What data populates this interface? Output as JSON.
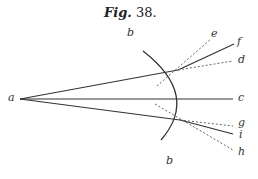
{
  "figure": {
    "title_word": "Fig.",
    "title_number": " 38.",
    "labels": {
      "a": "a",
      "b_top": "b",
      "b_bottom": "b",
      "c": "c",
      "d": "d",
      "e": "e",
      "f": "f",
      "g": "g",
      "h": "h",
      "i": "i"
    },
    "colors": {
      "line": "#333333",
      "dashed": "#555555"
    },
    "geometry": {
      "origin_a": [
        20,
        99
      ],
      "upper_intersection": [
        178,
        70
      ],
      "lower_intersection": [
        180,
        120
      ],
      "axis_end_c": [
        233,
        99
      ],
      "arc": {
        "start": [
          143,
          51
        ],
        "end": [
          161,
          140
        ],
        "rightmost_x": 184
      }
    }
  }
}
